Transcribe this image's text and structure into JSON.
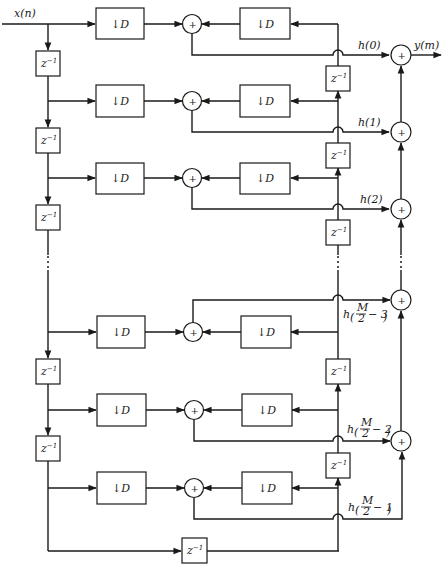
{
  "diagram": {
    "type": "polyphase FIR decimator structure (symmetric coefficients)",
    "input_label": "x(n)",
    "output_label": "y(m)",
    "downsampler_label": "↓D",
    "delay_label": "z",
    "delay_exponent": "−1",
    "adder_symbol": "+",
    "colors": {
      "ink": "#1a1a1a",
      "background": "#ffffff"
    },
    "coefficient_labels": [
      {
        "id": "h0",
        "text": "h(0)"
      },
      {
        "id": "h1",
        "text": "h(1)"
      },
      {
        "id": "h2",
        "text": "h(2)"
      },
      {
        "id": "hM3",
        "prefix": "h",
        "frac_num": "M",
        "frac_den": "2",
        "suffix": "− 3"
      },
      {
        "id": "hM2",
        "prefix": "h",
        "frac_num": "M",
        "frac_den": "2",
        "suffix": "− 2"
      },
      {
        "id": "hM1",
        "prefix": "h",
        "frac_num": "M",
        "frac_den": "2",
        "suffix": "− 1"
      }
    ],
    "branches": [
      {
        "index": 0,
        "coefficient": "h(0)"
      },
      {
        "index": 1,
        "coefficient": "h(1)"
      },
      {
        "index": 2,
        "coefficient": "h(2)"
      },
      {
        "index": "M/2-3",
        "coefficient": "h(M/2 − 3)"
      },
      {
        "index": "M/2-2",
        "coefficient": "h(M/2 − 2)"
      },
      {
        "index": "M/2-1",
        "coefficient": "h(M/2 − 1)"
      }
    ],
    "ellipsis": "⋮"
  }
}
